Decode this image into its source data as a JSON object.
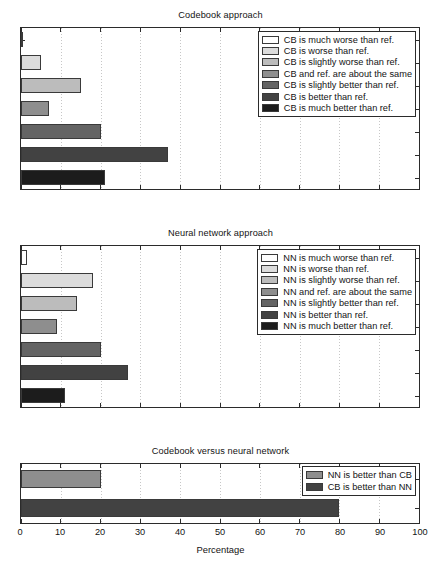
{
  "figure": {
    "xlabel": "Percentage",
    "xticks": [
      0,
      10,
      20,
      30,
      40,
      50,
      60,
      70,
      80,
      90,
      100
    ],
    "xlim": [
      0,
      100
    ]
  },
  "palette": {
    "much_worse": "#ffffff",
    "worse": "#dcdcdc",
    "slightly_worse": "#bcbcbc",
    "about_same": "#8e8e8e",
    "slightly_better": "#646464",
    "better": "#424242",
    "much_better": "#1c1c1c",
    "nn_better_than_cb": "#8e8e8e",
    "cb_better_than_nn": "#424242",
    "axis": "#2b2b2b",
    "grid": "#bdbdbd",
    "text": "#131313"
  },
  "chart_data": [
    {
      "type": "bar",
      "orientation": "horizontal",
      "title": "Codebook approach",
      "xlabel": "",
      "ylabel": "",
      "xlim": [
        0,
        100
      ],
      "xticks": [
        0,
        10,
        20,
        30,
        40,
        50,
        60,
        70,
        80,
        90,
        100
      ],
      "grid": true,
      "legend_position": "upper right",
      "categories": [
        "CB is much worse than ref.",
        "CB is worse than ref.",
        "CB is slightly worse than ref.",
        "CB and ref. are about the same",
        "CB is slightly better than ref.",
        "CB is better than ref.",
        "CB is much better than ref."
      ],
      "values": [
        0.3,
        5,
        15,
        7,
        20,
        37,
        21
      ],
      "colors": [
        "#ffffff",
        "#dcdcdc",
        "#bcbcbc",
        "#8e8e8e",
        "#646464",
        "#424242",
        "#1c1c1c"
      ]
    },
    {
      "type": "bar",
      "orientation": "horizontal",
      "title": "Neural network approach",
      "xlabel": "",
      "ylabel": "",
      "xlim": [
        0,
        100
      ],
      "xticks": [
        0,
        10,
        20,
        30,
        40,
        50,
        60,
        70,
        80,
        90,
        100
      ],
      "grid": true,
      "legend_position": "upper right",
      "categories": [
        "NN is much worse than ref.",
        "NN is worse than ref.",
        "NN is slightly worse than ref.",
        "NN and ref. are about the same",
        "NN is slightly better than ref.",
        "NN is better than ref.",
        "NN is much better than ref."
      ],
      "values": [
        1.5,
        18,
        14,
        9,
        20,
        27,
        11
      ],
      "colors": [
        "#ffffff",
        "#dcdcdc",
        "#bcbcbc",
        "#8e8e8e",
        "#646464",
        "#424242",
        "#1c1c1c"
      ]
    },
    {
      "type": "bar",
      "orientation": "horizontal",
      "title": "Codebook versus neural network",
      "xlabel": "Percentage",
      "ylabel": "",
      "xlim": [
        0,
        100
      ],
      "xticks": [
        0,
        10,
        20,
        30,
        40,
        50,
        60,
        70,
        80,
        90,
        100
      ],
      "grid": true,
      "legend_position": "upper right",
      "categories": [
        "NN is better than CB",
        "CB is better than NN"
      ],
      "values": [
        20,
        80
      ],
      "colors": [
        "#8e8e8e",
        "#424242"
      ]
    }
  ]
}
